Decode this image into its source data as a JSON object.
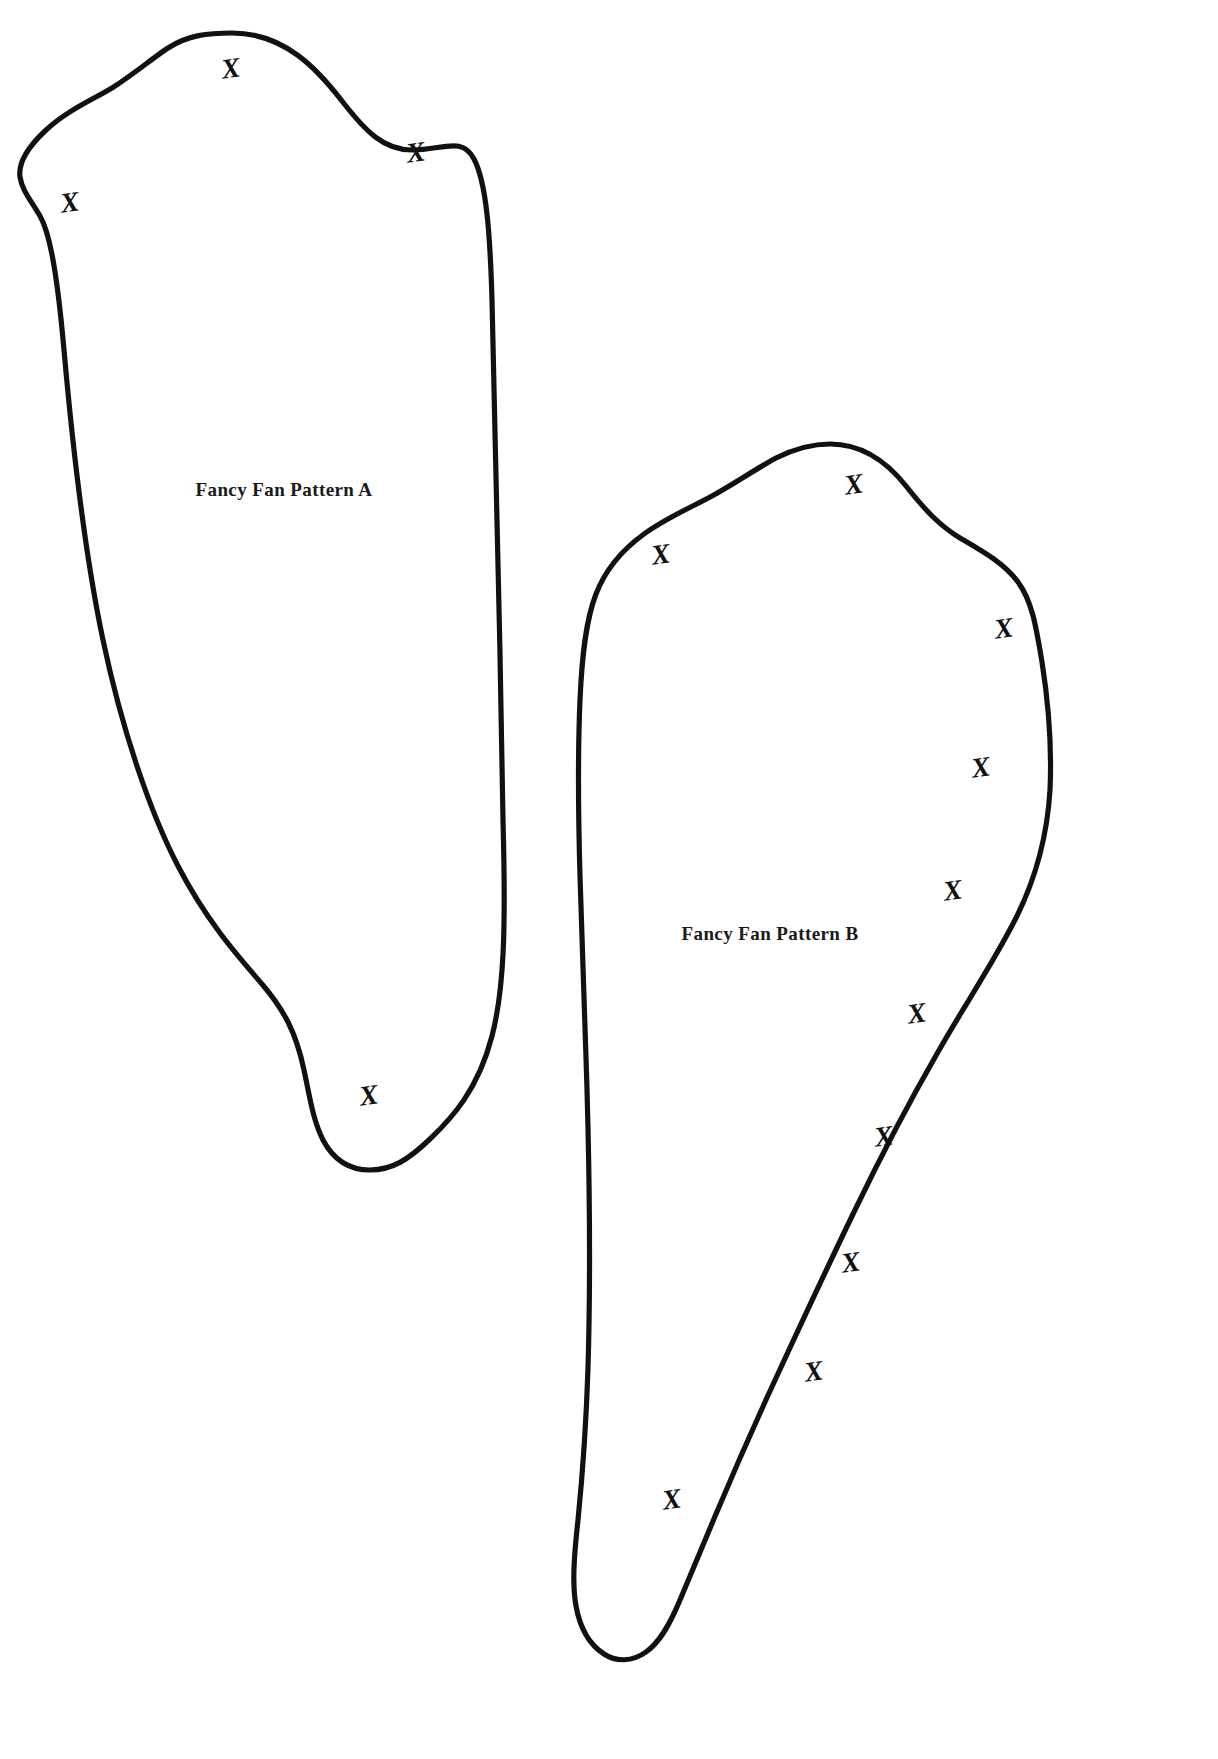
{
  "document": {
    "title": "Fancy Fan Pattern Sheet",
    "background_color": "#ffffff",
    "ink_color": "#111111",
    "width": 1218,
    "height": 1759
  },
  "patterns": [
    {
      "id": "pattern-a",
      "label": "Fancy Fan Pattern A",
      "label_x": 284,
      "label_y": 492,
      "label_size": 19,
      "outline_path": "M 232 33 C 285 33 318 70 342 101 C 366 132 384 150 412 150 C 443 150 462 136 474 159 C 486 182 490 230 492 300 C 495 400 500 640 503 820 C 506 930 504 990 492 1036 C 478 1090 452 1118 430 1139 C 408 1160 392 1170 370 1170 C 348 1170 333 1159 323 1140 C 313 1120 310 1098 304 1070 C 296 1032 284 1010 262 984 C 236 954 206 920 178 866 C 150 812 122 730 103 640 C 84 550 72 440 64 350 C 56 260 48 230 40 216 C 30 199 22 190 20 177 C 18 163 27 148 45 131 C 66 111 92 100 112 88 C 134 74 150 60 168 48 C 188 35 208 33 232 33 Z",
      "x_marks": [
        {
          "x": 231,
          "y": 71,
          "size": 28,
          "rotation": -8
        },
        {
          "x": 416,
          "y": 155,
          "size": 28,
          "rotation": -8
        },
        {
          "x": 70,
          "y": 205,
          "size": 28,
          "rotation": -8
        },
        {
          "x": 369,
          "y": 1098,
          "size": 28,
          "rotation": -8
        }
      ]
    },
    {
      "id": "pattern-b",
      "label": "Fancy Fan Pattern B",
      "label_x": 770,
      "label_y": 936,
      "label_size": 19,
      "outline_path": "M 830 444 C 862 444 887 462 906 486 C 925 510 940 526 960 538 C 982 551 1004 563 1018 582 C 1032 601 1036 626 1042 662 C 1048 700 1052 746 1050 790 C 1047 840 1035 880 1016 918 C 994 962 964 1006 938 1052 C 908 1104 880 1158 854 1212 C 826 1270 800 1326 776 1378 C 752 1430 732 1476 716 1514 C 700 1552 690 1576 680 1600 C 670 1624 660 1642 646 1652 C 632 1662 616 1662 604 1654 C 590 1645 580 1628 576 1606 C 572 1584 574 1556 578 1520 C 582 1480 586 1430 588 1368 C 590 1300 590 1216 588 1128 C 586 1040 582 948 580 876 C 578 806 578 746 580 700 C 582 654 586 620 596 594 C 606 568 622 550 644 534 C 666 518 690 508 712 496 C 734 484 754 470 776 458 C 796 448 812 444 830 444 Z",
      "x_marks": [
        {
          "x": 854,
          "y": 487,
          "size": 28,
          "rotation": -8
        },
        {
          "x": 661,
          "y": 557,
          "size": 28,
          "rotation": -8
        },
        {
          "x": 1004,
          "y": 631,
          "size": 28,
          "rotation": -8
        },
        {
          "x": 981,
          "y": 770,
          "size": 28,
          "rotation": -8
        },
        {
          "x": 953,
          "y": 893,
          "size": 28,
          "rotation": -8
        },
        {
          "x": 917,
          "y": 1016,
          "size": 28,
          "rotation": -8
        },
        {
          "x": 884,
          "y": 1139,
          "size": 28,
          "rotation": -8
        },
        {
          "x": 851,
          "y": 1265,
          "size": 28,
          "rotation": -8
        },
        {
          "x": 814,
          "y": 1374,
          "size": 28,
          "rotation": -8
        },
        {
          "x": 672,
          "y": 1502,
          "size": 28,
          "rotation": -8
        }
      ]
    }
  ],
  "xmark_glyph": "X"
}
